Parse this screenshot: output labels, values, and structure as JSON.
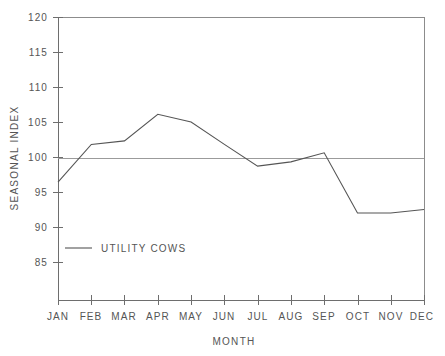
{
  "chart_data": {
    "type": "line",
    "title": "",
    "subtitle": "",
    "xlabel": "MONTH",
    "ylabel": "SEASONAL INDEX",
    "categories": [
      "JAN",
      "FEB",
      "MAR",
      "APR",
      "MAY",
      "JUN",
      "JUL",
      "AUG",
      "SEP",
      "OCT",
      "NOV",
      "DEC"
    ],
    "series": [
      {
        "name": "UTILITY COWS",
        "values": [
          96.4,
          101.8,
          102.3,
          106.1,
          105.0,
          101.8,
          98.7,
          99.3,
          100.6,
          92.0,
          92.0,
          92.5
        ],
        "color": "#555555"
      }
    ],
    "ylim": [
      81.5,
      120
    ],
    "ytick_values": [
      85,
      90,
      95,
      100,
      105,
      110,
      115,
      120
    ],
    "ytick_labels": [
      "85",
      "90",
      "95",
      "100",
      "105",
      "110",
      "115",
      "120"
    ],
    "reference_line": {
      "value": 99.8,
      "label": ""
    },
    "grid": false,
    "legend_position": "inside-lower-left",
    "legend_entries": [
      {
        "label": "UTILITY COWS",
        "color": "#555555",
        "marker": "line"
      }
    ],
    "axis_color": "#6e6e6e",
    "background_color": "#ffffff"
  }
}
